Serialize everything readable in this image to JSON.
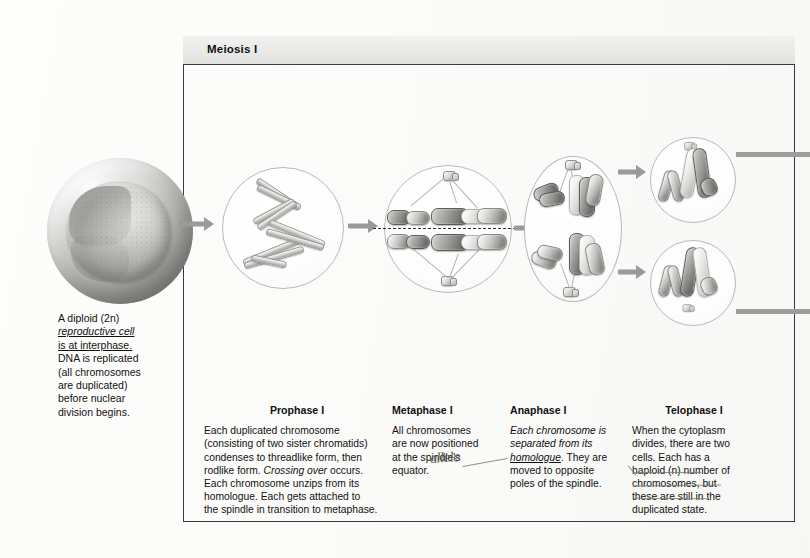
{
  "panel": {
    "header_title": "Meiosis I"
  },
  "interphase": {
    "caption_lines": [
      "A diploid (2n)",
      "reproductive cell",
      "is at interphase.",
      "DNA is replicated",
      "(all chromosomes",
      "are duplicated)",
      "before nuclear",
      "division begins."
    ],
    "caption_plain": "A diploid (2n) reproductive cell is at interphase. DNA is replicated (all chromosomes are duplicated) before nuclear division begins.",
    "cell_label": "interphase-cell"
  },
  "stages": [
    {
      "id": "prophase-1",
      "title": "Prophase I",
      "body": "Each duplicated chromosome (consisting of two sister chromatids) condenses to threadlike form, then rodlike form. Crossing over occurs. Each chromosome unzips from its homologue. Each gets attached to the spindle in transition to metaphase.",
      "lines": [
        "Each duplicated chromosome",
        "(consisting of two sister chromatids)",
        "condenses to threadlike form, then",
        "rodlike form. Crossing over occurs.",
        "Each chromosome unzips from its",
        "homologue. Each gets attached to",
        "the spindle in transition to metaphase."
      ],
      "italic_phrase": "Crossing over"
    },
    {
      "id": "metaphase-1",
      "title": "Metaphase I",
      "body": "All chromosomes are now positioned at the spindle's equator.",
      "lines": [
        "All chromosomes",
        "are now positioned",
        "at the spindle's",
        "equator."
      ]
    },
    {
      "id": "anaphase-1",
      "title": "Anaphase I",
      "body": "Each chromosome is separated from its homologue. They are moved to opposite poles of the spindle.",
      "lines": [
        "Each chromosome is",
        "separated from its",
        "homologue. They are",
        "moved to opposite",
        "poles of the spindle."
      ],
      "italic_phrase": "Each chromosome is separated from its homologue",
      "underlined_word": "homologue"
    },
    {
      "id": "telophase-1",
      "title": "Telophase I",
      "body": "When the cytoplasm divides, there are two cells. Each has a haploid (n) number of chromosomes, but these are still in the duplicated state.",
      "lines": [
        "When the cytoplasm",
        "divides, there are two",
        "cells. Each has a",
        "haploid (n) number of",
        "chromosomes, but",
        "these are still in the",
        "duplicated state."
      ],
      "underlined_words": [
        "chromosomes",
        "still in the",
        "duplicated state"
      ]
    }
  ],
  "annotation": {
    "handwriting_text": "allele",
    "points_to": "homologue"
  },
  "icons": {
    "arrow": "arrow-right-icon",
    "centriole": "centriole-icon",
    "spindle_fiber": "spindle-fiber-icon",
    "equator_line": "equator-dashed-line"
  },
  "colors": {
    "page_background": "#ffffff",
    "panel_border": "#3a3a3a",
    "header_fill": "#ebebea",
    "arrow_gray": "#9a9a9a",
    "chromosome_dark": "#6b6b68",
    "chromosome_light": "#e6e6e4",
    "text": "#111111",
    "pencil": "#7d7f70"
  }
}
